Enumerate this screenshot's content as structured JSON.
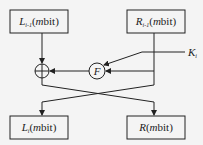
{
  "diagram": {
    "boxes": {
      "left_in": {
        "var": "L",
        "sub": "i-1",
        "suffix_m": "m",
        "suffix": "bit"
      },
      "right_in": {
        "var": "R",
        "sub": "i-1",
        "suffix_m": "m",
        "suffix": "bit"
      },
      "left_out": {
        "var": "L",
        "sub": "i",
        "suffix_m": "m",
        "suffix": "bit"
      },
      "right_out": {
        "var": "R",
        "sub": "",
        "suffix_m": "m",
        "suffix": "bit"
      }
    },
    "function_label": "F",
    "key": {
      "var": "K",
      "sub": "i"
    },
    "xor_symbol": "⊕",
    "stroke_color": "#222222"
  }
}
